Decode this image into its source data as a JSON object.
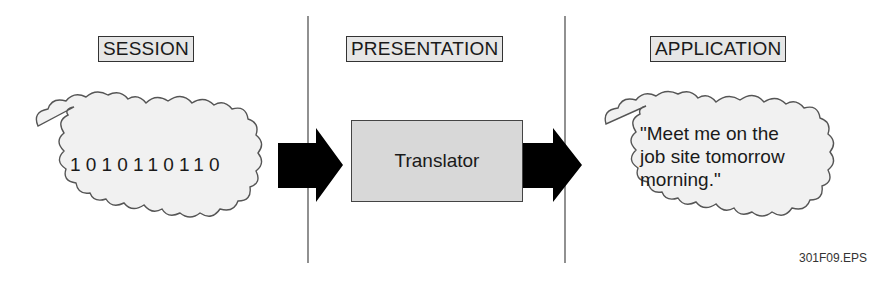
{
  "diagram": {
    "layers": [
      {
        "id": "session",
        "title": "SESSION",
        "content": "1010110110"
      },
      {
        "id": "presentation",
        "title": "PRESENTATION",
        "content": "Translator"
      },
      {
        "id": "application",
        "title": "APPLICATION",
        "content_lines": [
          "\"Meet me on the",
          "job site tomorrow",
          "morning.\""
        ]
      }
    ],
    "arrows": [
      {
        "from": "session",
        "to": "presentation"
      },
      {
        "from": "presentation",
        "to": "application"
      }
    ],
    "caption": "301F09.EPS",
    "colors": {
      "label_fill": "#e6e6e6",
      "cloud_fill": "#f1f1f1",
      "box_fill": "#d8d8d8",
      "arrow": "#000000",
      "outline": "#444444"
    }
  }
}
